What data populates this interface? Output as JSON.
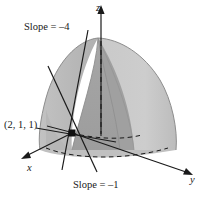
{
  "figure": {
    "kind": "3d-surface-tangent-lines-diagram",
    "background_color": "#ffffff",
    "ink_color": "#1a1a1a"
  },
  "axes": {
    "x_label": "x",
    "y_label": "y",
    "z_label": "z"
  },
  "annotations": {
    "slope_top": "Slope = –4",
    "slope_bottom": "Slope = –1",
    "point": "(2, 1, 1)"
  },
  "surface": {
    "name": "paraboloid-dome-cutaway",
    "outer_fill": "#b9b9b9",
    "outer_fill_light": "#cfcfcf",
    "cut_face_fill": "#a8a8a8",
    "cut_face_fill_dark": "#9a9a9a",
    "base_fill": "#c4c4c4",
    "edge_color": "#8f8f8f"
  },
  "marker": {
    "name": "tangent-point-marker",
    "fill": "#111111",
    "x": 72,
    "y": 133
  },
  "tangent_lines": [
    {
      "name": "tangent-line-slope-minus-4"
    },
    {
      "name": "tangent-line-slope-minus-1"
    },
    {
      "name": "tangent-line-third"
    }
  ]
}
